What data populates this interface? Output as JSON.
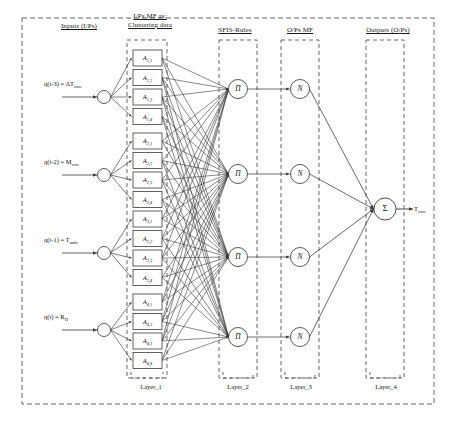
{
  "figure": {
    "type": "anfis-network-diagram",
    "title_headers": [
      {
        "id": "inputs",
        "text": "Inputs (I/Ps)",
        "x": 40,
        "y": 22,
        "w": 78
      },
      {
        "id": "ipsmf",
        "text": "I/Ps MF as:\nClustering data",
        "x": 114,
        "y": 12,
        "w": 72
      },
      {
        "id": "rules",
        "text": "SFIS-Rules",
        "x": 206,
        "y": 26,
        "w": 58
      },
      {
        "id": "opsmf",
        "text": "O/Ps MF",
        "x": 272,
        "y": 26,
        "w": 56
      },
      {
        "id": "outputs",
        "text": "Outputs (O/Ps)",
        "x": 352,
        "y": 26,
        "w": 72
      }
    ],
    "inputs": [
      {
        "id": "in1",
        "label": "q(t-3) = ΔT",
        "sub": "cow",
        "cx": 104,
        "cy": 97
      },
      {
        "id": "in2",
        "label": "q(t-2) = M",
        "sub": "cow",
        "cx": 104,
        "cy": 175
      },
      {
        "id": "in3",
        "label": "q(t-1) = T",
        "sub": "amb",
        "cx": 104,
        "cy": 253
      },
      {
        "id": "in4",
        "label": "q(t) = R",
        "sub": "H",
        "cx": 104,
        "cy": 330
      }
    ],
    "mf_groups": [
      {
        "group": 1,
        "nodes": [
          {
            "label": "A",
            "sub": "1,1"
          },
          {
            "label": "A",
            "sub": "1,2"
          },
          {
            "label": "A",
            "sub": "1,3"
          },
          {
            "label": "A",
            "sub": "1,4"
          }
        ]
      },
      {
        "group": 2,
        "nodes": [
          {
            "label": "A",
            "sub": "2,1"
          },
          {
            "label": "A",
            "sub": "2,2"
          },
          {
            "label": "A",
            "sub": "2,3"
          },
          {
            "label": "A",
            "sub": "2,4"
          }
        ]
      },
      {
        "group": 3,
        "nodes": [
          {
            "label": "A",
            "sub": "3,1"
          },
          {
            "label": "A",
            "sub": "3,2"
          },
          {
            "label": "A",
            "sub": "3,3"
          },
          {
            "label": "A",
            "sub": "3,4"
          }
        ]
      },
      {
        "group": 4,
        "nodes": [
          {
            "label": "A",
            "sub": "4,1"
          },
          {
            "label": "A",
            "sub": "4,2"
          },
          {
            "label": "A",
            "sub": "4,3"
          },
          {
            "label": "A",
            "sub": "4,4"
          }
        ]
      }
    ],
    "rule_nodes": [
      {
        "id": "rule1",
        "symbol": "Π",
        "cx": 238,
        "cy": 89
      },
      {
        "id": "rule2",
        "symbol": "Π",
        "cx": 238,
        "cy": 174
      },
      {
        "id": "rule3",
        "symbol": "Π",
        "cx": 238,
        "cy": 257
      },
      {
        "id": "rule4",
        "symbol": "Π",
        "cx": 238,
        "cy": 337
      }
    ],
    "norm_nodes": [
      {
        "id": "norm1",
        "symbol": "N",
        "cx": 300,
        "cy": 89
      },
      {
        "id": "norm2",
        "symbol": "N",
        "cx": 300,
        "cy": 174
      },
      {
        "id": "norm3",
        "symbol": "N",
        "cx": 300,
        "cy": 257
      },
      {
        "id": "norm4",
        "symbol": "N",
        "cx": 300,
        "cy": 337
      }
    ],
    "sum_node": {
      "id": "sum",
      "symbol": "Σ",
      "cx": 385,
      "cy": 209
    },
    "output": {
      "label": "T",
      "sub": "cow",
      "x": 414,
      "y": 205
    },
    "layer_labels": [
      {
        "text": "Layer_1",
        "x": 128,
        "y": 383
      },
      {
        "text": "Layer_2",
        "x": 215,
        "y": 383
      },
      {
        "text": "Layer_3",
        "x": 278,
        "y": 383
      },
      {
        "text": "Layer_4",
        "x": 363,
        "y": 383
      }
    ],
    "colors": {
      "stroke": "#3a3a3a",
      "dashed": "#555555",
      "text": "#111111",
      "background": "#ffffff"
    }
  }
}
